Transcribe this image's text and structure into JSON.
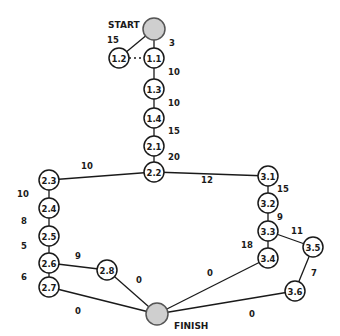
{
  "diagram": {
    "title_start": "START",
    "title_finish": "FINISH",
    "nodes": [
      {
        "id": "START",
        "label": "",
        "x": 154,
        "y": 29,
        "r": 11,
        "terminal": true
      },
      {
        "id": "1.1",
        "label": "1.1",
        "x": 154,
        "y": 58,
        "r": 10
      },
      {
        "id": "1.2",
        "label": "1.2",
        "x": 119,
        "y": 58,
        "r": 10
      },
      {
        "id": "1.3",
        "label": "1.3",
        "x": 154,
        "y": 89,
        "r": 10
      },
      {
        "id": "1.4",
        "label": "1.4",
        "x": 154,
        "y": 118,
        "r": 10
      },
      {
        "id": "2.1",
        "label": "2.1",
        "x": 154,
        "y": 146,
        "r": 10
      },
      {
        "id": "2.2",
        "label": "2.2",
        "x": 154,
        "y": 172,
        "r": 10
      },
      {
        "id": "2.3",
        "label": "2.3",
        "x": 49,
        "y": 180,
        "r": 10
      },
      {
        "id": "2.4",
        "label": "2.4",
        "x": 49,
        "y": 208,
        "r": 10
      },
      {
        "id": "2.5",
        "label": "2.5",
        "x": 49,
        "y": 236,
        "r": 10
      },
      {
        "id": "2.6",
        "label": "2.6",
        "x": 49,
        "y": 263,
        "r": 10
      },
      {
        "id": "2.7",
        "label": "2.7",
        "x": 49,
        "y": 287,
        "r": 10
      },
      {
        "id": "2.8",
        "label": "2.8",
        "x": 107,
        "y": 270,
        "r": 10
      },
      {
        "id": "3.1",
        "label": "3.1",
        "x": 268,
        "y": 176,
        "r": 10
      },
      {
        "id": "3.2",
        "label": "3.2",
        "x": 268,
        "y": 203,
        "r": 10
      },
      {
        "id": "3.3",
        "label": "3.3",
        "x": 268,
        "y": 231,
        "r": 10
      },
      {
        "id": "3.4",
        "label": "3.4",
        "x": 268,
        "y": 258,
        "r": 10
      },
      {
        "id": "3.5",
        "label": "3.5",
        "x": 313,
        "y": 247,
        "r": 10
      },
      {
        "id": "3.6",
        "label": "3.6",
        "x": 295,
        "y": 291,
        "r": 10
      },
      {
        "id": "FINISH",
        "label": "",
        "x": 157,
        "y": 314,
        "r": 11,
        "terminal": true
      }
    ],
    "edges": [
      {
        "from": "START",
        "to": "1.2",
        "weight": "15",
        "lx": 113,
        "ly": 40
      },
      {
        "from": "START",
        "to": "1.1",
        "weight": "3",
        "lx": 172,
        "ly": 43
      },
      {
        "from": "1.2",
        "to": "1.1",
        "weight": "",
        "dotted": true
      },
      {
        "from": "1.1",
        "to": "1.3",
        "weight": "10",
        "lx": 174,
        "ly": 72
      },
      {
        "from": "1.3",
        "to": "1.4",
        "weight": "10",
        "lx": 174,
        "ly": 103
      },
      {
        "from": "1.4",
        "to": "2.1",
        "weight": "15",
        "lx": 174,
        "ly": 131
      },
      {
        "from": "2.1",
        "to": "2.2",
        "weight": "20",
        "lx": 174,
        "ly": 157
      },
      {
        "from": "2.2",
        "to": "2.3",
        "weight": "10",
        "lx": 87,
        "ly": 166
      },
      {
        "from": "2.2",
        "to": "3.1",
        "weight": "12",
        "lx": 207,
        "ly": 180
      },
      {
        "from": "2.3",
        "to": "2.4",
        "weight": "10",
        "lx": 23,
        "ly": 194
      },
      {
        "from": "2.4",
        "to": "2.5",
        "weight": "8",
        "lx": 24,
        "ly": 221
      },
      {
        "from": "2.5",
        "to": "2.6",
        "weight": "5",
        "lx": 24,
        "ly": 246
      },
      {
        "from": "2.6",
        "to": "2.7",
        "weight": "6",
        "lx": 24,
        "ly": 277
      },
      {
        "from": "2.6",
        "to": "2.8",
        "weight": "9",
        "lx": 78,
        "ly": 256
      },
      {
        "from": "2.8",
        "to": "FINISH",
        "weight": "0",
        "lx": 139,
        "ly": 280
      },
      {
        "from": "2.7",
        "to": "FINISH",
        "weight": "0",
        "lx": 78,
        "ly": 311
      },
      {
        "from": "3.1",
        "to": "3.2",
        "weight": "15",
        "lx": 283,
        "ly": 189
      },
      {
        "from": "3.2",
        "to": "3.3",
        "weight": "9",
        "lx": 280,
        "ly": 217
      },
      {
        "from": "3.3",
        "to": "3.4",
        "weight": "18",
        "lx": 247,
        "ly": 245
      },
      {
        "from": "3.3",
        "to": "3.5",
        "weight": "11",
        "lx": 297,
        "ly": 231
      },
      {
        "from": "3.4",
        "to": "FINISH",
        "weight": "0",
        "lx": 210,
        "ly": 273
      },
      {
        "from": "3.5",
        "to": "3.6",
        "weight": "7",
        "lx": 314,
        "ly": 273
      },
      {
        "from": "3.6",
        "to": "FINISH",
        "weight": "0",
        "lx": 252,
        "ly": 314
      }
    ]
  }
}
